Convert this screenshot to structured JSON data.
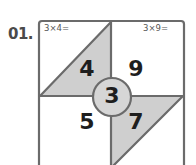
{
  "question": {
    "number": "01."
  },
  "puzzle": {
    "equations": {
      "top_left": "3×4=",
      "top_right": "3×9="
    },
    "center": "3",
    "quadrants": {
      "top_left": "4",
      "top_right": "9",
      "bottom_left": "5",
      "bottom_right": "7"
    },
    "colors": {
      "fill": "#cfcfcf",
      "stroke": "#6b6b6b",
      "background": "#ffffff"
    }
  }
}
